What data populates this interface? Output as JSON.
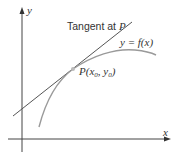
{
  "diagram": {
    "type": "tangent-line-illustration",
    "axes": {
      "x_label": "x",
      "y_label": "y"
    },
    "labels": {
      "tangent_prefix": "Tangent at ",
      "tangent_point": "P",
      "curve": "y = f(x)",
      "point_prefix": "P(x",
      "point_sub0": "0",
      "point_mid": ", y",
      "point_sub1": "0",
      "point_suffix": ")"
    },
    "colors": {
      "axis": "#333333",
      "tangent": "#555555",
      "curve": "#9a9a9a",
      "point": "#aaaaaa"
    }
  }
}
